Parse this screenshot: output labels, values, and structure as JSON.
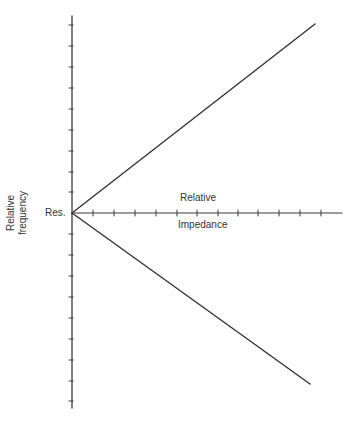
{
  "diagram": {
    "y_axis_label_line1": "Relative",
    "y_axis_label_line2": "frequency",
    "origin_label": "Res.",
    "x_axis_label_top": "Relative",
    "x_axis_label_bottom": "Impedance",
    "colors": {
      "axis": "#3a3a3a",
      "lines": "#333333",
      "text": "#333333",
      "background": "#ffffff"
    },
    "geometry": {
      "origin": [
        72,
        213
      ],
      "y_axis_top": 16,
      "y_axis_bottom": 408,
      "x_axis_right": 342,
      "upper_line_end": [
        315,
        24
      ],
      "lower_line_end": [
        310,
        384
      ],
      "x_ticks": [
        93,
        114,
        135,
        156,
        177,
        197,
        218,
        238,
        258,
        279,
        300,
        321
      ],
      "y_ticks_above": [
        25,
        46,
        67,
        88,
        109,
        130,
        151,
        172,
        192
      ],
      "y_ticks_below": [
        234,
        255,
        276,
        297,
        318,
        339,
        360,
        381,
        401
      ]
    }
  }
}
